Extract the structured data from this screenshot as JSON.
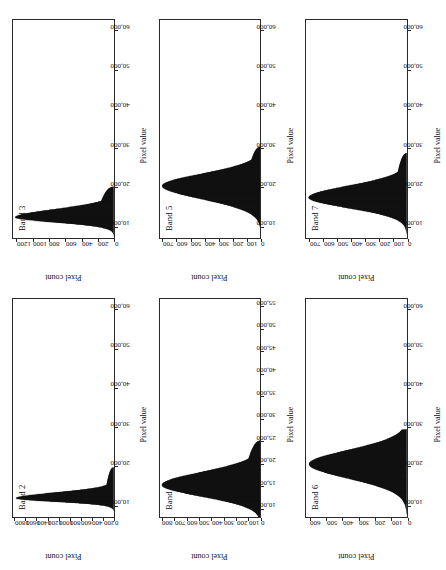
{
  "figure": {
    "orientation_note": "page rotated 90 degrees counter-clockwise",
    "axis_titles": {
      "x": "Pixel value",
      "y": "Pixel count"
    }
  },
  "chart_data": [
    {
      "type": "bar",
      "title": "Band 2",
      "xlabel": "Pixel value",
      "ylabel": "Pixel count",
      "xlim": [
        7000,
        63000
      ],
      "ylim": [
        0,
        1850
      ],
      "xticks": [
        10000,
        20000,
        30000,
        40000,
        50000,
        60000
      ],
      "xticklabels": [
        "10,000",
        "20,000",
        "30,000",
        "40,000",
        "50,000",
        "60,000"
      ],
      "yticks": [
        0,
        200,
        400,
        600,
        800,
        1000,
        1200,
        1400,
        1600,
        1800
      ],
      "yticklabels": [
        "0",
        "200",
        "400",
        "600",
        "800",
        "1000",
        "1200",
        "1400",
        "1600",
        "1800"
      ],
      "grid": false,
      "peak_x": 11800,
      "peak_y": 1800,
      "left_sigma": 900,
      "right_sigma": 1500,
      "tail_level": 170,
      "tail_end_x": 19800,
      "x": [
        8600,
        9200,
        9600,
        10000,
        10300,
        10600,
        10900,
        11200,
        11500,
        11800,
        12100,
        12500,
        12900,
        13400,
        14000,
        14800,
        15600,
        16400,
        17200,
        18000,
        18800,
        19400,
        19800,
        20200
      ],
      "values": [
        30,
        120,
        340,
        700,
        1050,
        1360,
        1600,
        1740,
        1790,
        1800,
        1720,
        1500,
        1180,
        850,
        600,
        430,
        340,
        290,
        250,
        225,
        205,
        190,
        120,
        10
      ]
    },
    {
      "type": "bar",
      "title": "Band 3",
      "xlabel": "Pixel value",
      "ylabel": "Pixel count",
      "xlim": [
        7000,
        63000
      ],
      "ylim": [
        0,
        1260
      ],
      "xticks": [
        10000,
        20000,
        30000,
        40000,
        50000,
        60000
      ],
      "xticklabels": [
        "10,000",
        "20,000",
        "30,000",
        "40,000",
        "50,000",
        "60,000"
      ],
      "yticks": [
        0,
        200,
        400,
        600,
        800,
        1000,
        1200
      ],
      "yticklabels": [
        "0",
        "200",
        "400",
        "600",
        "800",
        "1000",
        "1200"
      ],
      "grid": false,
      "peak_x": 12300,
      "peak_y": 1235,
      "left_sigma": 1300,
      "right_sigma": 2100,
      "tail_level": 220,
      "tail_end_x": 20200,
      "x": [
        8400,
        9000,
        9600,
        10200,
        10800,
        11300,
        11800,
        12300,
        12800,
        13400,
        14000,
        14800,
        15600,
        16400,
        17200,
        18000,
        18800,
        19600,
        20200,
        20600
      ],
      "values": [
        20,
        80,
        230,
        470,
        760,
        980,
        1150,
        1235,
        1200,
        1080,
        900,
        700,
        540,
        430,
        360,
        310,
        275,
        245,
        180,
        15
      ]
    },
    {
      "type": "bar",
      "title": "Band 4",
      "xlabel": "Pixel value",
      "ylabel": "Pixel count",
      "xlim": [
        8000,
        57000
      ],
      "ylim": [
        0,
        830
      ],
      "xticks": [
        10000,
        15000,
        20000,
        25000,
        30000,
        35000,
        40000,
        45000,
        50000,
        55000
      ],
      "xticklabels": [
        "10,000",
        "15,000",
        "20,000",
        "25,000",
        "30,000",
        "35,000",
        "40,000",
        "45,000",
        "50,000",
        "55,000"
      ],
      "yticks": [
        0,
        100,
        200,
        300,
        400,
        500,
        600,
        700,
        800
      ],
      "yticklabels": [
        "0",
        "100",
        "200",
        "300",
        "400",
        "500",
        "600",
        "700",
        "800"
      ],
      "grid": false,
      "peak_x": 15200,
      "peak_y": 815,
      "left_sigma": 2600,
      "right_sigma": 2900,
      "tail_level": 150,
      "tail_end_x": 25200,
      "x": [
        9200,
        10000,
        10800,
        11600,
        12400,
        13200,
        14000,
        14600,
        15200,
        15800,
        16600,
        17400,
        18400,
        19400,
        20600,
        21800,
        23000,
        24200,
        25200,
        25800
      ],
      "values": [
        60,
        130,
        220,
        340,
        470,
        600,
        720,
        785,
        815,
        800,
        740,
        650,
        520,
        400,
        300,
        240,
        200,
        175,
        120,
        10
      ]
    },
    {
      "type": "bar",
      "title": "Band 5",
      "xlabel": "Pixel value",
      "ylabel": "Pixel count",
      "xlim": [
        7000,
        63000
      ],
      "ylim": [
        0,
        730
      ],
      "xticks": [
        10000,
        20000,
        30000,
        40000,
        50000,
        60000
      ],
      "xticklabels": [
        "10,000",
        "20,000",
        "30,000",
        "40,000",
        "50,000",
        "60,000"
      ],
      "yticks": [
        0,
        100,
        200,
        300,
        400,
        500,
        600,
        700
      ],
      "yticklabels": [
        "0",
        "100",
        "200",
        "300",
        "400",
        "500",
        "600",
        "700"
      ],
      "grid": false,
      "peak_x": 20400,
      "peak_y": 715,
      "left_sigma": 3400,
      "right_sigma": 3100,
      "tail_level": 110,
      "tail_end_x": 30500,
      "x": [
        11500,
        12800,
        14000,
        15200,
        16400,
        17600,
        18600,
        19500,
        20400,
        21200,
        22200,
        23400,
        24800,
        26200,
        27600,
        29000,
        30000,
        30600
      ],
      "values": [
        25,
        70,
        140,
        250,
        380,
        520,
        630,
        695,
        715,
        700,
        640,
        540,
        410,
        300,
        220,
        160,
        105,
        10
      ]
    },
    {
      "type": "bar",
      "title": "Band 6",
      "xlabel": "Pixel value",
      "ylabel": "Pixel count",
      "xlim": [
        7000,
        63000
      ],
      "ylim": [
        0,
        630
      ],
      "xticks": [
        10000,
        20000,
        30000,
        40000,
        50000,
        60000
      ],
      "xticklabels": [
        "10,000",
        "20,000",
        "30,000",
        "40,000",
        "50,000",
        "60,000"
      ],
      "yticks": [
        0,
        100,
        200,
        300,
        400,
        500,
        600
      ],
      "yticklabels": [
        "0",
        "100",
        "200",
        "300",
        "400",
        "500",
        "600"
      ],
      "grid": false,
      "peak_x": 20600,
      "peak_y": 612,
      "left_sigma": 3700,
      "right_sigma": 3600,
      "tail_level": 60,
      "tail_end_x": 29500,
      "x": [
        11000,
        12500,
        14000,
        15400,
        16800,
        18000,
        19200,
        20000,
        20600,
        21400,
        22400,
        23600,
        25000,
        26400,
        27800,
        29000,
        29600
      ],
      "values": [
        15,
        45,
        110,
        210,
        330,
        450,
        550,
        600,
        612,
        600,
        550,
        460,
        350,
        250,
        165,
        95,
        10
      ]
    },
    {
      "type": "bar",
      "title": "Band 7",
      "xlabel": "Pixel value",
      "ylabel": "Pixel count",
      "xlim": [
        7000,
        63000
      ],
      "ylim": [
        0,
        730
      ],
      "xticks": [
        10000,
        20000,
        30000,
        40000,
        50000,
        60000
      ],
      "xticklabels": [
        "10,000",
        "20,000",
        "30,000",
        "40,000",
        "50,000",
        "60,000"
      ],
      "yticks": [
        0,
        100,
        200,
        300,
        400,
        500,
        600,
        700
      ],
      "yticklabels": [
        "0",
        "100",
        "200",
        "300",
        "400",
        "500",
        "600",
        "700"
      ],
      "grid": false,
      "peak_x": 17400,
      "peak_y": 712,
      "left_sigma": 2700,
      "right_sigma": 3000,
      "tail_level": 95,
      "tail_end_x": 28800,
      "x": [
        10400,
        11600,
        12800,
        13800,
        14800,
        15800,
        16600,
        17400,
        18200,
        19200,
        20400,
        21800,
        23400,
        25000,
        26600,
        28000,
        28800
      ],
      "values": [
        20,
        65,
        160,
        290,
        430,
        570,
        670,
        712,
        700,
        640,
        540,
        420,
        310,
        225,
        165,
        110,
        10
      ]
    }
  ]
}
